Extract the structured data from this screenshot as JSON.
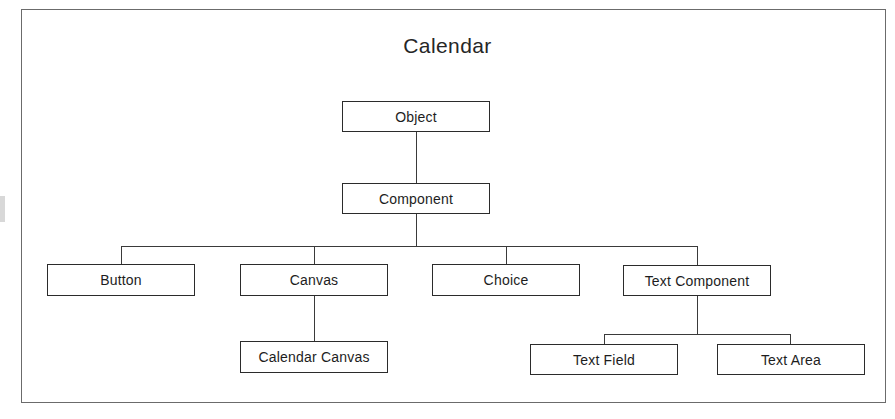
{
  "diagram": {
    "title": "Calendar",
    "type": "class-hierarchy-tree",
    "nodes": [
      {
        "id": "object",
        "label": "Object",
        "level": 0
      },
      {
        "id": "component",
        "label": "Component",
        "level": 1
      },
      {
        "id": "button",
        "label": "Button",
        "level": 2
      },
      {
        "id": "canvas",
        "label": "Canvas",
        "level": 2
      },
      {
        "id": "choice",
        "label": "Choice",
        "level": 2
      },
      {
        "id": "text-component",
        "label": "Text Component",
        "level": 2
      },
      {
        "id": "calendar-canvas",
        "label": "Calendar Canvas",
        "level": 3
      },
      {
        "id": "text-field",
        "label": "Text Field",
        "level": 3
      },
      {
        "id": "text-area",
        "label": "Text Area",
        "level": 3
      }
    ],
    "edges": [
      {
        "from": "object",
        "to": "component"
      },
      {
        "from": "component",
        "to": "button"
      },
      {
        "from": "component",
        "to": "canvas"
      },
      {
        "from": "component",
        "to": "choice"
      },
      {
        "from": "component",
        "to": "text-component"
      },
      {
        "from": "canvas",
        "to": "calendar-canvas"
      },
      {
        "from": "text-component",
        "to": "text-field"
      },
      {
        "from": "text-component",
        "to": "text-area"
      }
    ]
  },
  "colors": {
    "background": "#ffffff",
    "frame_border": "#6b6b6b",
    "node_border": "#2b2b2b",
    "node_fill": "#ffffff",
    "connector": "#3a3a3a",
    "text": "#1d1d1d",
    "title_text": "#262626"
  }
}
